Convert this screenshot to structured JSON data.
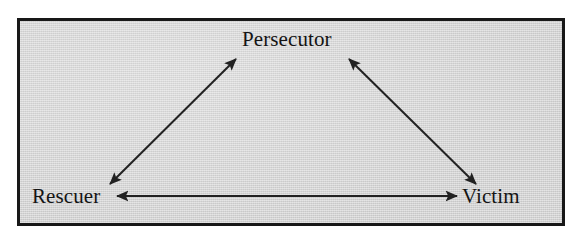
{
  "figure": {
    "name": "drama-triangle",
    "background_color": "#ffffff",
    "panel": {
      "fill_color": "#d2d2d2",
      "border_color": "#181818",
      "border_width_px": 3
    }
  },
  "chart_data": {
    "type": "diagram",
    "title": "",
    "nodes": [
      {
        "id": "persecutor",
        "label": "Persecutor",
        "x": 293,
        "y": 40
      },
      {
        "id": "rescuer",
        "label": "Rescuer",
        "x": 71,
        "y": 197
      },
      {
        "id": "victim",
        "label": "Victim",
        "x": 493,
        "y": 197
      }
    ],
    "edges": [
      {
        "id": "rescuer-persecutor",
        "from": "rescuer",
        "to": "persecutor",
        "arrowheads": "both",
        "x1": 110,
        "y1": 184,
        "x2": 236,
        "y2": 59
      },
      {
        "id": "persecutor-victim",
        "from": "persecutor",
        "to": "victim",
        "arrowheads": "both",
        "x1": 349,
        "y1": 59,
        "x2": 476,
        "y2": 184
      },
      {
        "id": "rescuer-victim",
        "from": "rescuer",
        "to": "victim",
        "arrowheads": "both",
        "x1": 117,
        "y1": 196,
        "x2": 457,
        "y2": 196
      }
    ],
    "line_color": "#222222",
    "line_width_px": 2
  },
  "labels": {
    "persecutor": "Persecutor",
    "rescuer": "Rescuer",
    "victim": "Victim"
  }
}
